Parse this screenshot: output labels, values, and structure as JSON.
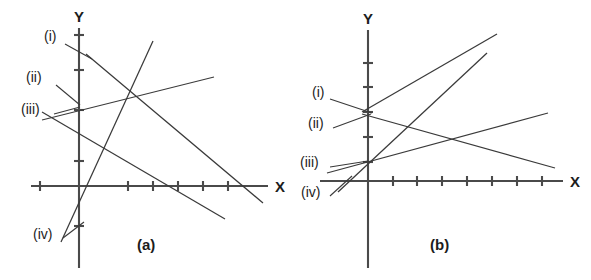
{
  "figure": {
    "background_color": "#ffffff",
    "ink_color": "#3a3a3a",
    "axis_color": "#4a4a4a",
    "text_color": "#1c1c1c"
  },
  "panels": [
    {
      "id": "a",
      "caption": "(a)",
      "axis_labels": {
        "x": "X",
        "y": "Y"
      },
      "origin": {
        "x": 79,
        "y": 186
      },
      "tick_spacing": 25,
      "x_axis": {
        "start_x": 31,
        "end_x": 268,
        "ticks_x": [
          40,
          128,
          153,
          178,
          203,
          228
        ]
      },
      "y_axis": {
        "start_y": 28,
        "end_y": 268,
        "ticks_y": [
          35,
          70,
          110,
          161,
          226
        ]
      },
      "line_labels": [
        {
          "text": "(i)",
          "x": 44,
          "y": 41
        },
        {
          "text": "(ii)",
          "x": 26,
          "y": 82
        },
        {
          "text": "(iii)",
          "x": 21,
          "y": 114
        },
        {
          "text": "(iv)",
          "x": 33,
          "y": 239
        }
      ],
      "leaders": [
        {
          "from_x": 65,
          "from_y": 44,
          "to_x": 92,
          "to_y": 59
        },
        {
          "from_x": 56,
          "from_y": 85,
          "to_x": 80,
          "to_y": 105
        },
        {
          "from_x": 54,
          "from_y": 114,
          "to_x": 80,
          "to_y": 107
        },
        {
          "from_x": 63,
          "from_y": 238,
          "to_x": 84,
          "to_y": 222
        }
      ],
      "lines": [
        {
          "label": "(i)",
          "x1": 86,
          "y1": 54,
          "x2": 263,
          "y2": 203
        },
        {
          "label": "(ii)",
          "x1": 42,
          "y1": 120,
          "x2": 214,
          "y2": 77
        },
        {
          "label": "(iii)",
          "x1": 42,
          "y1": 112,
          "x2": 225,
          "y2": 219
        },
        {
          "label": "(iv)",
          "x1": 61,
          "y1": 242,
          "x2": 153,
          "y2": 41
        }
      ]
    },
    {
      "id": "b",
      "caption": "(b)",
      "axis_labels": {
        "x": "X",
        "y": "Y"
      },
      "origin": {
        "x": 368,
        "y": 181
      },
      "tick_spacing": 25,
      "x_axis": {
        "start_x": 320,
        "end_x": 563,
        "ticks_x": [
          393,
          417,
          442,
          467,
          492,
          517,
          542
        ]
      },
      "y_axis": {
        "start_y": 30,
        "end_y": 268,
        "ticks_y": [
          63,
          87,
          112,
          137,
          162
        ]
      },
      "line_labels": [
        {
          "text": "(i)",
          "x": 312,
          "y": 97
        },
        {
          "text": "(ii)",
          "x": 308,
          "y": 128
        },
        {
          "text": "(iii)",
          "x": 300,
          "y": 167
        },
        {
          "text": "(iv)",
          "x": 301,
          "y": 197
        }
      ],
      "leaders": [
        {
          "from_x": 330,
          "from_y": 99,
          "to_x": 372,
          "to_y": 113
        },
        {
          "from_x": 333,
          "from_y": 128,
          "to_x": 371,
          "to_y": 114
        },
        {
          "from_x": 330,
          "from_y": 167,
          "to_x": 368,
          "to_y": 161
        },
        {
          "from_x": 330,
          "from_y": 196,
          "to_x": 352,
          "to_y": 176
        }
      ],
      "lines": [
        {
          "label": "(i)",
          "x1": 362,
          "y1": 114,
          "x2": 555,
          "y2": 168
        },
        {
          "label": "(ii)",
          "x1": 362,
          "y1": 112,
          "x2": 497,
          "y2": 34
        },
        {
          "label": "(iii)",
          "x1": 327,
          "y1": 173,
          "x2": 548,
          "y2": 113
        },
        {
          "label": "(iv)",
          "x1": 338,
          "y1": 192,
          "x2": 487,
          "y2": 53
        }
      ]
    }
  ]
}
